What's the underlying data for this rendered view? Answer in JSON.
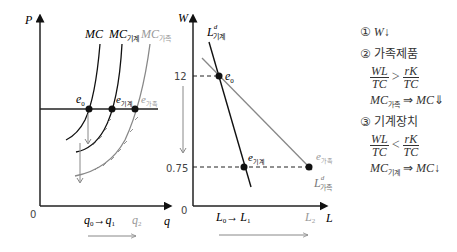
{
  "left_chart": {
    "y_axis_label": "P",
    "x_axis_label": "q",
    "origin_label": "0",
    "curves": [
      {
        "name": "MC",
        "label": "MC",
        "sub": "",
        "color": "#111111"
      },
      {
        "name": "MC_machine",
        "label": "MC",
        "sub": "기계",
        "color": "#111111"
      },
      {
        "name": "MC_household",
        "label": "MC",
        "sub": "가족",
        "color": "#888888"
      }
    ],
    "points": [
      {
        "label": "e",
        "sub": "0"
      },
      {
        "label": "e",
        "sub": "기계"
      },
      {
        "label": "e",
        "sub": "가족"
      }
    ],
    "x_ticks": {
      "q0": "q",
      "q0_sub": "0",
      "arrow": "→",
      "q1": "q",
      "q1_sub": "1",
      "q2": "q",
      "q2_sub": "2"
    }
  },
  "right_chart": {
    "y_axis_label": "W",
    "x_axis_label": "L",
    "origin_label": "0",
    "y_ticks": [
      "12",
      "0.75"
    ],
    "curves": [
      {
        "name": "Ld_machine",
        "label": "L",
        "sup": "d",
        "sub": "기계",
        "color": "#111111"
      },
      {
        "name": "Ld_household",
        "label": "L",
        "sup": "d",
        "sub": "가족",
        "color": "#888888"
      }
    ],
    "points": [
      {
        "label": "e",
        "sub": "0"
      },
      {
        "label": "e",
        "sub": "기계"
      },
      {
        "label": "e",
        "sub": "가족"
      }
    ],
    "x_ticks": {
      "L0": "L",
      "L0_sub": "0",
      "arrow": "→",
      "L1": "L",
      "L1_sub": "1",
      "L2": "L",
      "L2_sub": "2"
    }
  },
  "notes": {
    "item1": {
      "num": "①",
      "text": "W",
      "arrow": "↓"
    },
    "item2": {
      "num": "②",
      "title": "가족제품",
      "frac_left_num": "WL",
      "frac_left_den": "TC",
      "op": ">",
      "frac_right_num": "rK",
      "frac_right_den": "TC",
      "mc_from": "MC",
      "mc_from_sub": "가족",
      "implies": "⇒",
      "mc_to": "MC",
      "arrow": "⇓"
    },
    "item3": {
      "num": "③",
      "title": "기계장치",
      "frac_left_num": "WL",
      "frac_left_den": "TC",
      "op": "<",
      "frac_right_num": "rK",
      "frac_right_den": "TC",
      "mc_from": "MC",
      "mc_from_sub": "기계",
      "implies": "⇒",
      "mc_to": "MC",
      "arrow": "↓"
    }
  }
}
